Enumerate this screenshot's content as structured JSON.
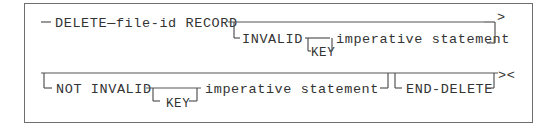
{
  "diagram": {
    "type": "syntax-railroad",
    "statement": "DELETE",
    "row1": {
      "main": "DELETE—file-id RECORD",
      "optional_clause": {
        "keyword": "INVALID",
        "optional_key": "KEY",
        "operand": "imperative statement"
      },
      "continuation_marker": ">"
    },
    "row2": {
      "optional_clause": {
        "keyword": "NOT INVALID",
        "optional_key": "KEY",
        "operand": "imperative statement"
      },
      "optional_terminator": "END-DELETE",
      "end_marker": "><"
    },
    "colors": {
      "line": "#555555",
      "text": "#333333",
      "border": "#6e6e6e"
    }
  }
}
